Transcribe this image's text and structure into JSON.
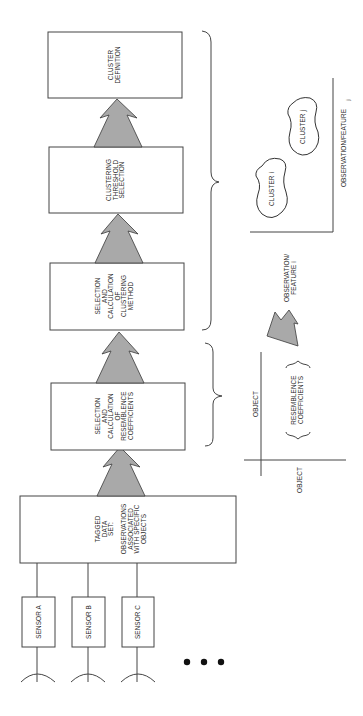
{
  "diagram": {
    "sensors": [
      {
        "label": "SENSOR A"
      },
      {
        "label": "SENSOR B"
      },
      {
        "label": "SENSOR C"
      }
    ],
    "more_indicator": "• • •",
    "steps": [
      {
        "lines": [
          "TAGGED",
          "DATA",
          "SET:",
          "",
          "OBSERVATIONS",
          "ASSOCIATED",
          "WITH SPECIFIC",
          "OBJECTS"
        ]
      },
      {
        "lines": [
          "SELECTION",
          "AND",
          "CALCULATION",
          "OF",
          "RESEMBLENCE",
          "COEFFICIENTS"
        ]
      },
      {
        "lines": [
          "SELECTION",
          "AND",
          "CALCULATION",
          "OF",
          "CLUSTERING",
          "METHOD"
        ]
      },
      {
        "lines": [
          "CLUSTERING",
          "THRESHOLD",
          "SELECTION"
        ]
      },
      {
        "lines": [
          "CLUSTER",
          "DEFINITION"
        ]
      }
    ],
    "matrix_inset": {
      "row_axis_label": "OBJECT",
      "col_axis_label": "OBJECT",
      "content_lines": [
        "RESEMBLENCE",
        "COEFFICIENTS"
      ]
    },
    "cluster_inset": {
      "x_axis_label_lines": [
        "OBSERVATION/",
        "FEATURE i"
      ],
      "y_axis_label": "OBSERVATION/FEATURE",
      "y_axis_subscript": "j",
      "clusters": [
        {
          "label": "CLUSTER i"
        },
        {
          "label": "CLUSTER j"
        }
      ]
    },
    "colors": {
      "arrow_fill": "#a9a9a9",
      "line": "#444444",
      "background": "#ffffff"
    }
  }
}
